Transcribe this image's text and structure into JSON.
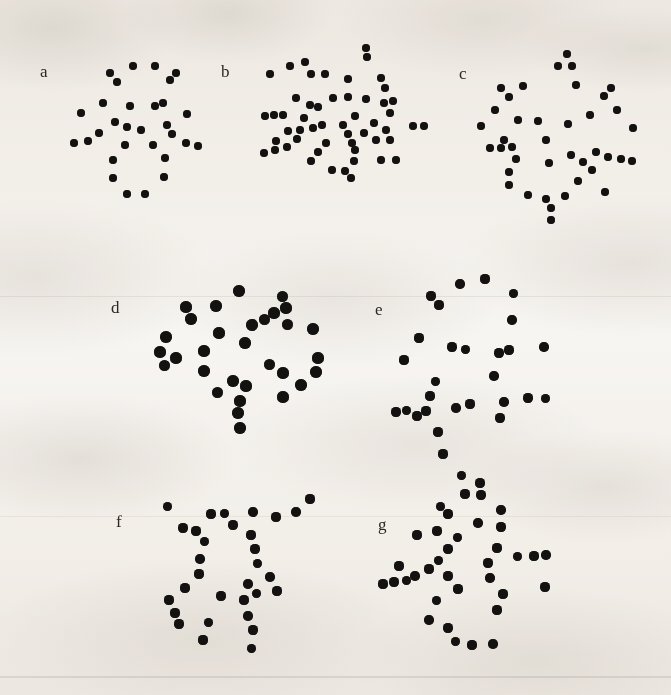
{
  "figure": {
    "background_color": "#f7f5f2",
    "dot_color": "#131210",
    "label_color": "#2b2823",
    "width": 671,
    "height": 695
  },
  "chart_data": {
    "type": "scatter",
    "title": "",
    "subtitle": "",
    "xlabel": "",
    "ylabel": "",
    "grid": false,
    "legend": "none",
    "axes": "none",
    "panel_count": 7,
    "panels": [
      {
        "label": "a",
        "label_x": 40,
        "label_y": 63,
        "dot_diameter": 8,
        "dot_count": 28,
        "origin_x": 0,
        "origin_y": 0,
        "points": [
          [
            133,
            66
          ],
          [
            155,
            66
          ],
          [
            110,
            73
          ],
          [
            176,
            73
          ],
          [
            117,
            82
          ],
          [
            170,
            80
          ],
          [
            103,
            103
          ],
          [
            163,
            103
          ],
          [
            130,
            106
          ],
          [
            155,
            106
          ],
          [
            81,
            113
          ],
          [
            187,
            114
          ],
          [
            127,
            127
          ],
          [
            141,
            130
          ],
          [
            115,
            122
          ],
          [
            167,
            125
          ],
          [
            99,
            133
          ],
          [
            172,
            134
          ],
          [
            74,
            143
          ],
          [
            88,
            141
          ],
          [
            125,
            145
          ],
          [
            153,
            145
          ],
          [
            186,
            143
          ],
          [
            198,
            146
          ],
          [
            113,
            160
          ],
          [
            165,
            158
          ],
          [
            113,
            178
          ],
          [
            164,
            177
          ],
          [
            127,
            194
          ],
          [
            145,
            194
          ]
        ]
      },
      {
        "label": "b",
        "label_x": 221,
        "label_y": 63,
        "dot_diameter": 8,
        "dot_count": 50,
        "origin_x": 0,
        "origin_y": 0,
        "points": [
          [
            366,
            48
          ],
          [
            367,
            57
          ],
          [
            290,
            66
          ],
          [
            305,
            62
          ],
          [
            270,
            74
          ],
          [
            311,
            74
          ],
          [
            325,
            74
          ],
          [
            348,
            79
          ],
          [
            381,
            78
          ],
          [
            385,
            88
          ],
          [
            296,
            98
          ],
          [
            333,
            98
          ],
          [
            348,
            97
          ],
          [
            366,
            99
          ],
          [
            310,
            105
          ],
          [
            318,
            107
          ],
          [
            384,
            103
          ],
          [
            393,
            101
          ],
          [
            265,
            116
          ],
          [
            274,
            115
          ],
          [
            283,
            115
          ],
          [
            304,
            118
          ],
          [
            355,
            116
          ],
          [
            390,
            113
          ],
          [
            322,
            125
          ],
          [
            343,
            125
          ],
          [
            374,
            123
          ],
          [
            413,
            126
          ],
          [
            424,
            126
          ],
          [
            288,
            131
          ],
          [
            300,
            130
          ],
          [
            313,
            128
          ],
          [
            348,
            134
          ],
          [
            364,
            133
          ],
          [
            386,
            130
          ],
          [
            276,
            141
          ],
          [
            297,
            139
          ],
          [
            326,
            143
          ],
          [
            352,
            143
          ],
          [
            376,
            140
          ],
          [
            390,
            140
          ],
          [
            264,
            153
          ],
          [
            275,
            150
          ],
          [
            287,
            147
          ],
          [
            318,
            152
          ],
          [
            355,
            150
          ],
          [
            311,
            161
          ],
          [
            354,
            161
          ],
          [
            381,
            160
          ],
          [
            396,
            160
          ],
          [
            332,
            170
          ],
          [
            345,
            171
          ],
          [
            351,
            178
          ]
        ]
      },
      {
        "label": "c",
        "label_x": 459,
        "label_y": 65,
        "dot_diameter": 8,
        "dot_count": 44,
        "origin_x": 0,
        "origin_y": 0,
        "points": [
          [
            567,
            54
          ],
          [
            558,
            66
          ],
          [
            572,
            66
          ],
          [
            523,
            86
          ],
          [
            576,
            85
          ],
          [
            501,
            88
          ],
          [
            611,
            88
          ],
          [
            509,
            97
          ],
          [
            604,
            96
          ],
          [
            495,
            110
          ],
          [
            617,
            110
          ],
          [
            518,
            120
          ],
          [
            590,
            115
          ],
          [
            538,
            121
          ],
          [
            568,
            124
          ],
          [
            481,
            126
          ],
          [
            633,
            128
          ],
          [
            504,
            140
          ],
          [
            546,
            140
          ],
          [
            490,
            148
          ],
          [
            501,
            148
          ],
          [
            512,
            147
          ],
          [
            516,
            159
          ],
          [
            571,
            155
          ],
          [
            596,
            152
          ],
          [
            608,
            157
          ],
          [
            621,
            159
          ],
          [
            632,
            161
          ],
          [
            549,
            163
          ],
          [
            583,
            162
          ],
          [
            509,
            172
          ],
          [
            592,
            170
          ],
          [
            509,
            185
          ],
          [
            578,
            181
          ],
          [
            528,
            195
          ],
          [
            565,
            196
          ],
          [
            605,
            192
          ],
          [
            546,
            199
          ],
          [
            551,
            208
          ],
          [
            551,
            220
          ]
        ]
      },
      {
        "label": "d",
        "label_x": 111,
        "label_y": 299,
        "dot_diameter": 11,
        "dot_count": 31,
        "origin_x": 0,
        "origin_y": 0,
        "points": [
          [
            239,
            291
          ],
          [
            282,
            296
          ],
          [
            186,
            307
          ],
          [
            216,
            306
          ],
          [
            274,
            313
          ],
          [
            191,
            319
          ],
          [
            264,
            319
          ],
          [
            286,
            308
          ],
          [
            166,
            337
          ],
          [
            219,
            333
          ],
          [
            252,
            325
          ],
          [
            287,
            324
          ],
          [
            160,
            352
          ],
          [
            313,
            329
          ],
          [
            204,
            351
          ],
          [
            245,
            343
          ],
          [
            164,
            365
          ],
          [
            176,
            358
          ],
          [
            204,
            371
          ],
          [
            318,
            358
          ],
          [
            233,
            381
          ],
          [
            269,
            364
          ],
          [
            283,
            373
          ],
          [
            316,
            372
          ],
          [
            246,
            386
          ],
          [
            301,
            385
          ],
          [
            217,
            392
          ],
          [
            240,
            401
          ],
          [
            238,
            413
          ],
          [
            283,
            397
          ],
          [
            240,
            428
          ]
        ]
      },
      {
        "label": "e",
        "label_x": 375,
        "label_y": 301,
        "dot_diameter": 9,
        "dot_count": 30,
        "origin_x": 0,
        "origin_y": 0,
        "points": [
          [
            460,
            284
          ],
          [
            485,
            279
          ],
          [
            431,
            296
          ],
          [
            513,
            293
          ],
          [
            439,
            305
          ],
          [
            512,
            320
          ],
          [
            419,
            338
          ],
          [
            452,
            347
          ],
          [
            465,
            349
          ],
          [
            509,
            350
          ],
          [
            544,
            347
          ],
          [
            404,
            360
          ],
          [
            499,
            353
          ],
          [
            435,
            381
          ],
          [
            430,
            396
          ],
          [
            494,
            376
          ],
          [
            426,
            411
          ],
          [
            396,
            412
          ],
          [
            406,
            410
          ],
          [
            417,
            416
          ],
          [
            456,
            408
          ],
          [
            470,
            404
          ],
          [
            528,
            398
          ],
          [
            545,
            398
          ],
          [
            438,
            432
          ],
          [
            504,
            402
          ],
          [
            443,
            454
          ],
          [
            500,
            418
          ],
          [
            461,
            475
          ],
          [
            480,
            483
          ]
        ]
      },
      {
        "label": "f",
        "label_x": 116,
        "label_y": 513,
        "dot_diameter": 9,
        "dot_count": 31,
        "origin_x": 0,
        "origin_y": 0,
        "points": [
          [
            167,
            506
          ],
          [
            211,
            514
          ],
          [
            253,
            512
          ],
          [
            310,
            499
          ],
          [
            183,
            528
          ],
          [
            224,
            513
          ],
          [
            276,
            517
          ],
          [
            296,
            512
          ],
          [
            196,
            531
          ],
          [
            233,
            525
          ],
          [
            204,
            541
          ],
          [
            251,
            535
          ],
          [
            200,
            559
          ],
          [
            199,
            574
          ],
          [
            255,
            549
          ],
          [
            257,
            563
          ],
          [
            185,
            588
          ],
          [
            248,
            584
          ],
          [
            169,
            600
          ],
          [
            221,
            596
          ],
          [
            256,
            593
          ],
          [
            277,
            591
          ],
          [
            270,
            577
          ],
          [
            175,
            613
          ],
          [
            179,
            624
          ],
          [
            208,
            622
          ],
          [
            244,
            600
          ],
          [
            248,
            616
          ],
          [
            203,
            640
          ],
          [
            253,
            630
          ],
          [
            251,
            648
          ]
        ]
      },
      {
        "label": "g",
        "label_x": 378,
        "label_y": 516,
        "dot_diameter": 9,
        "dot_count": 32,
        "origin_x": 0,
        "origin_y": 0,
        "points": [
          [
            465,
            494
          ],
          [
            481,
            495
          ],
          [
            440,
            506
          ],
          [
            448,
            514
          ],
          [
            501,
            510
          ],
          [
            437,
            531
          ],
          [
            501,
            527
          ],
          [
            457,
            537
          ],
          [
            417,
            535
          ],
          [
            478,
            523
          ],
          [
            399,
            566
          ],
          [
            448,
            549
          ],
          [
            438,
            560
          ],
          [
            497,
            548
          ],
          [
            415,
            576
          ],
          [
            429,
            569
          ],
          [
            488,
            563
          ],
          [
            517,
            556
          ],
          [
            534,
            556
          ],
          [
            546,
            555
          ],
          [
            383,
            584
          ],
          [
            394,
            582
          ],
          [
            406,
            580
          ],
          [
            448,
            576
          ],
          [
            490,
            578
          ],
          [
            458,
            589
          ],
          [
            545,
            587
          ],
          [
            436,
            600
          ],
          [
            503,
            594
          ],
          [
            429,
            620
          ],
          [
            497,
            610
          ],
          [
            448,
            628
          ],
          [
            455,
            641
          ],
          [
            472,
            645
          ],
          [
            493,
            644
          ]
        ]
      }
    ]
  }
}
